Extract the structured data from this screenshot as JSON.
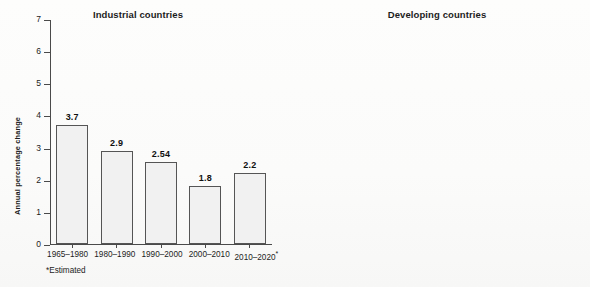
{
  "figure": {
    "footnote": "*Estimated",
    "bar_color_light": "#f1f1f1",
    "bar_color_dark": "#adadad",
    "axis_color": "#4a4a4a"
  },
  "panels": [
    {
      "title": "Industrial countries",
      "ylabel": "Annual percentage change"
    },
    {
      "title": "Developing countries",
      "ylabel": "Annual percentage change"
    }
  ],
  "yticks": [
    "0",
    "1",
    "2",
    "3",
    "4",
    "5",
    "6",
    "7"
  ],
  "categories": [
    "1965–1980",
    "1980–1990",
    "1990–2000",
    "2000–2010",
    "2010–2020"
  ],
  "category_last_marker": "*",
  "labels_left": [
    "3.7",
    "2.9",
    "2.54",
    "1.8",
    "2.2"
  ],
  "labels_right": [
    "5.9",
    "4.12",
    "5.37",
    "4.3",
    "6.5"
  ],
  "chart_data": [
    {
      "type": "bar",
      "title": "Industrial countries",
      "xlabel": "",
      "ylabel": "Annual percentage change",
      "categories": [
        "1965–1980",
        "1980–1990",
        "1990–2000",
        "2000–2010",
        "2010–2020*"
      ],
      "values": [
        3.7,
        2.9,
        2.54,
        1.8,
        2.2
      ],
      "data_labels": [
        "3.7",
        "2.9",
        "2.54",
        "1.8",
        "2.2"
      ],
      "ylim": [
        0,
        7
      ],
      "ytick_step": 1,
      "grid": false,
      "legend": "none",
      "bar_fill": "#f1f1f1",
      "bar_stroke": "#555555",
      "note": "*Estimated"
    },
    {
      "type": "bar",
      "title": "Developing countries",
      "xlabel": "",
      "ylabel": "Annual percentage change",
      "categories": [
        "1965–1980",
        "1980–1990",
        "1990–2000",
        "2000–2010",
        "2010–2020*"
      ],
      "values": [
        5.9,
        4.12,
        5.37,
        4.3,
        6.5
      ],
      "data_labels": [
        "5.9",
        "4.12",
        "5.37",
        "4.3",
        "6.5"
      ],
      "ylim": [
        0,
        7
      ],
      "ytick_step": 1,
      "grid": false,
      "legend": "none",
      "bar_fill": "#adadad",
      "bar_stroke": "#5a5a5a"
    }
  ]
}
